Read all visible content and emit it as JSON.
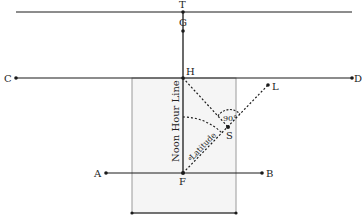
{
  "caption": "a dial of the long plane (partially cut off)",
  "diagram": {
    "points": {
      "T": {
        "label": "T",
        "x": 183,
        "y": 12
      },
      "G": {
        "label": "G",
        "x": 183,
        "y": 31
      },
      "C": {
        "label": "C",
        "x": 16,
        "y": 78
      },
      "D": {
        "label": "D",
        "x": 352,
        "y": 78
      },
      "H": {
        "label": "H",
        "x": 183,
        "y": 78
      },
      "L": {
        "label": "L",
        "x": 268,
        "y": 85
      },
      "S": {
        "label": "S",
        "x": 228,
        "y": 127
      },
      "A": {
        "label": "A",
        "x": 106,
        "y": 173
      },
      "B": {
        "label": "B",
        "x": 262,
        "y": 173
      },
      "F": {
        "label": "F",
        "x": 183,
        "y": 173
      }
    },
    "labels": {
      "noon_line": "Noon Hour Line",
      "latitude": "Latitude",
      "right_angle": "90°",
      "degree_mark": "°"
    },
    "colors": {
      "line": "#1a1a1a",
      "rect_stroke": "#9a9a9a",
      "rect_fill": "#f4f4f4"
    }
  }
}
